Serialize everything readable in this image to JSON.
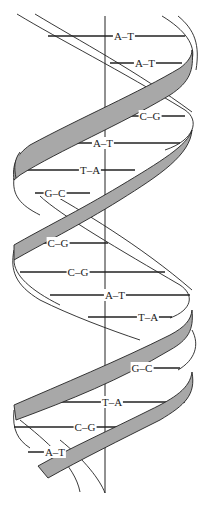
{
  "diagram": {
    "colors": {
      "ribbon_fill": "#a8a8a8",
      "stroke": "#222222",
      "background": "#ffffff"
    },
    "base_pairs": [
      {
        "label": "A–T",
        "y": 36,
        "x1": 48,
        "x2": 185,
        "cx": 124
      },
      {
        "label": "A–T",
        "y": 63,
        "x1": 110,
        "x2": 182,
        "cx": 145
      },
      {
        "label": "C–G",
        "y": 116,
        "x1": 120,
        "x2": 185,
        "cx": 150
      },
      {
        "label": "A–T",
        "y": 143,
        "x1": 64,
        "x2": 180,
        "cx": 103
      },
      {
        "label": "T–A",
        "y": 170,
        "x1": 18,
        "x2": 135,
        "cx": 90
      },
      {
        "label": "G–C",
        "y": 193,
        "x1": 35,
        "x2": 90,
        "cx": 55
      },
      {
        "label": "C–G",
        "y": 243,
        "x1": 35,
        "x2": 108,
        "cx": 58
      },
      {
        "label": "C–G",
        "y": 272,
        "x1": 20,
        "x2": 165,
        "cx": 78
      },
      {
        "label": "A–T",
        "y": 295,
        "x1": 50,
        "x2": 190,
        "cx": 115
      },
      {
        "label": "T–A",
        "y": 317,
        "x1": 88,
        "x2": 172,
        "cx": 148
      },
      {
        "label": "G–C",
        "y": 368,
        "x1": 113,
        "x2": 180,
        "cx": 142
      },
      {
        "label": "T–A",
        "y": 402,
        "x1": 44,
        "x2": 185,
        "cx": 112
      },
      {
        "label": "C–G",
        "y": 427,
        "x1": 14,
        "x2": 140,
        "cx": 85
      },
      {
        "label": "A–T",
        "y": 452,
        "x1": 28,
        "x2": 85,
        "cx": 55
      }
    ]
  }
}
